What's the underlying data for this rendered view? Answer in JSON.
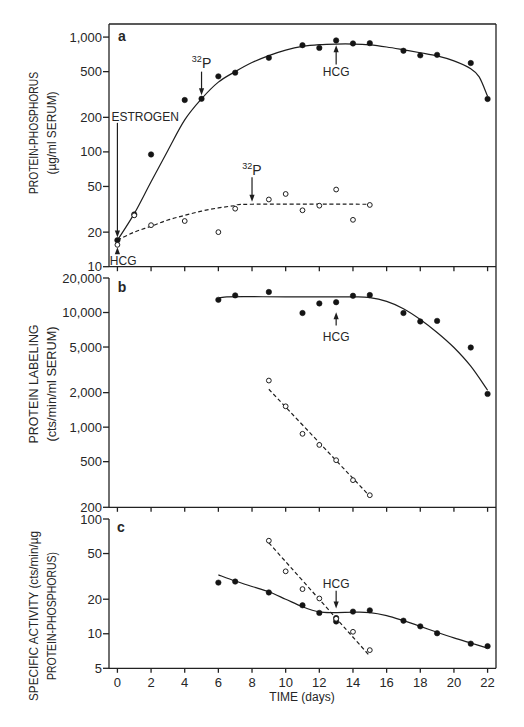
{
  "chart_data": {
    "type": "scatter",
    "title": "",
    "xlabel": "TIME (days)",
    "xlim": [
      -0.5,
      22.5
    ],
    "xticks": [
      0,
      2,
      4,
      6,
      8,
      10,
      12,
      14,
      16,
      18,
      20,
      22
    ],
    "xtick_labels": [
      "0",
      "2",
      "4",
      "6",
      "8",
      "10",
      "12",
      "14",
      "16",
      "18",
      "20",
      "22"
    ],
    "grid": false,
    "legend": "none",
    "panels": [
      {
        "id": "a",
        "letter": "a",
        "ylabel_lines": [
          "PROTEIN-PHOSPHORUS",
          "(µg/ml SERUM)"
        ],
        "yscale": "log",
        "ylim": [
          10,
          1300
        ],
        "yticks": [
          10,
          20,
          50,
          100,
          200,
          500,
          1000
        ],
        "ytick_labels": [
          "10",
          "20",
          "50",
          "100",
          "200",
          "500",
          "1,000"
        ],
        "series": [
          {
            "name": "filled",
            "marker": "filled-circle",
            "points": [
              [
                0,
                17
              ],
              [
                1,
                28.5
              ],
              [
                2,
                95
              ],
              [
                4,
                283
              ],
              [
                5,
                290
              ],
              [
                6,
                455
              ],
              [
                7,
                490
              ],
              [
                9,
                660
              ],
              [
                11,
                850
              ],
              [
                12,
                805
              ],
              [
                13,
                935
              ],
              [
                14,
                880
              ],
              [
                15,
                885
              ],
              [
                17,
                760
              ],
              [
                18,
                693
              ],
              [
                19,
                700
              ],
              [
                21,
                594
              ],
              [
                22,
                289
              ]
            ]
          },
          {
            "name": "open",
            "marker": "open-circle",
            "points": [
              [
                0,
                15.5
              ],
              [
                1,
                28
              ],
              [
                2,
                23
              ],
              [
                4,
                25
              ],
              [
                6,
                20
              ],
              [
                7,
                32
              ],
              [
                9,
                38.5
              ],
              [
                10,
                43
              ],
              [
                11,
                31
              ],
              [
                12,
                34
              ],
              [
                13,
                47
              ],
              [
                14,
                25.6
              ],
              [
                15,
                34.5
              ]
            ]
          }
        ],
        "fits": [
          {
            "name": "filled-fit",
            "style": "solid",
            "points": [
              [
                0,
                17
              ],
              [
                1,
                29
              ],
              [
                2,
                55
              ],
              [
                3,
                103
              ],
              [
                4,
                190
              ],
              [
                5,
                290
              ],
              [
                6,
                405
              ],
              [
                7,
                500
              ],
              [
                8,
                600
              ],
              [
                9,
                690
              ],
              [
                10,
                770
              ],
              [
                11,
                830
              ],
              [
                12,
                860
              ],
              [
                13,
                870
              ],
              [
                14,
                870
              ],
              [
                15,
                855
              ],
              [
                16,
                820
              ],
              [
                17,
                775
              ],
              [
                18,
                730
              ],
              [
                19,
                685
              ],
              [
                20,
                620
              ],
              [
                21,
                530
              ],
              [
                21.5,
                450
              ],
              [
                22,
                305
              ]
            ]
          },
          {
            "name": "open-fit",
            "style": "dashed",
            "points": [
              [
                0,
                17
              ],
              [
                1,
                20
              ],
              [
                2,
                22.5
              ],
              [
                3,
                25.5
              ],
              [
                4,
                28
              ],
              [
                5,
                30.5
              ],
              [
                6,
                32.5
              ],
              [
                7,
                34
              ],
              [
                8,
                35
              ],
              [
                15,
                35
              ]
            ]
          }
        ],
        "annotations": [
          {
            "text": "ESTROGEN",
            "x": 0,
            "tip": 18,
            "tail": 179,
            "label_x": -0.35,
            "label_y": 200,
            "anchor": "start"
          },
          {
            "text": "HCG",
            "x": 0,
            "tip": 14.8,
            "tail": 12.9,
            "label_x": -0.45,
            "label_y": 11.2,
            "anchor": "start"
          },
          {
            "sup": "32",
            "text": "P",
            "x": 5,
            "tip": 311,
            "tail": 500,
            "label_y": 590
          },
          {
            "sup": "32",
            "text": "P",
            "x": 8,
            "tip": 36.8,
            "tail": 60,
            "label_y": 69
          },
          {
            "text": "HCG",
            "x": 13,
            "tip": 847,
            "tail": 577,
            "label_y": 493
          }
        ]
      },
      {
        "id": "b",
        "letter": "b",
        "ylabel_lines": [
          "PROTEIN LABELING",
          "(cts/min/ml SERUM)"
        ],
        "yscale": "log",
        "ylim": [
          200,
          20000
        ],
        "yticks": [
          200,
          500,
          1000,
          2000,
          5000,
          10000,
          20000
        ],
        "ytick_labels": [
          "200",
          "500",
          "1,000",
          "2,000",
          "5,000",
          "10,000",
          "20,000"
        ],
        "series": [
          {
            "name": "filled",
            "marker": "filled-circle",
            "points": [
              [
                6,
                12900
              ],
              [
                7,
                14100
              ],
              [
                9,
                15100
              ],
              [
                11,
                9900
              ],
              [
                12,
                12000
              ],
              [
                13,
                12300
              ],
              [
                14,
                14000
              ],
              [
                15,
                14200
              ],
              [
                17,
                9900
              ],
              [
                18,
                8350
              ],
              [
                19,
                8450
              ],
              [
                21,
                4950
              ],
              [
                22,
                1950
              ]
            ]
          },
          {
            "name": "open",
            "marker": "open-circle",
            "points": [
              [
                9,
                2550
              ],
              [
                10,
                1520
              ],
              [
                11,
                875
              ],
              [
                12,
                700
              ],
              [
                13,
                515
              ],
              [
                14,
                345
              ],
              [
                15,
                255
              ]
            ]
          }
        ],
        "fits": [
          {
            "name": "filled-fit",
            "style": "solid",
            "points": [
              [
                6,
                12900
              ],
              [
                6.5,
                13700
              ],
              [
                10,
                13700
              ],
              [
                14,
                13700
              ],
              [
                15,
                13500
              ],
              [
                16,
                12500
              ],
              [
                17,
                10800
              ],
              [
                18,
                8700
              ],
              [
                19,
                6700
              ],
              [
                20,
                4950
              ],
              [
                21,
                3400
              ],
              [
                22,
                2100
              ]
            ]
          },
          {
            "name": "open-fit",
            "style": "dashed",
            "points": [
              [
                9,
                2140
              ],
              [
                15,
                250
              ]
            ]
          }
        ],
        "annotations": [
          {
            "text": "HCG",
            "x": 13,
            "tip": 10040,
            "tail": 7700,
            "label_y": 6080
          }
        ]
      },
      {
        "id": "c",
        "letter": "c",
        "ylabel_lines": [
          "SPECIFIC ACTIVITY (cts/min/µg",
          "PROTEIN-PHOSPHORUS)"
        ],
        "yscale": "log",
        "ylim": [
          5,
          100
        ],
        "yticks": [
          5,
          10,
          20,
          50,
          100
        ],
        "ytick_labels": [
          "5",
          "10",
          "20",
          "50",
          "100"
        ],
        "series": [
          {
            "name": "filled",
            "marker": "filled-circle",
            "points": [
              [
                6,
                27.9
              ],
              [
                7,
                28.5
              ],
              [
                9,
                22.9
              ],
              [
                11,
                17.7
              ],
              [
                12,
                15.2
              ],
              [
                13,
                13.7
              ],
              [
                13,
                12.8
              ],
              [
                14,
                15.6
              ],
              [
                15,
                16
              ],
              [
                17,
                13
              ],
              [
                18,
                11.6
              ],
              [
                19,
                10.1
              ],
              [
                21,
                8.2
              ],
              [
                22,
                7.8
              ]
            ]
          },
          {
            "name": "open",
            "marker": "open-circle",
            "points": [
              [
                9,
                64.7
              ],
              [
                10,
                35
              ],
              [
                11,
                24.5
              ],
              [
                12,
                20.3
              ],
              [
                13,
                13.5
              ],
              [
                14,
                10.4
              ],
              [
                15,
                7.2
              ]
            ]
          }
        ],
        "fits": [
          {
            "name": "filled-fit",
            "style": "solid",
            "points": [
              [
                6,
                32.6
              ],
              [
                7,
                28.8
              ],
              [
                8,
                25.8
              ],
              [
                9,
                23.2
              ],
              [
                10,
                20
              ],
              [
                11,
                17.2
              ],
              [
                12,
                15.5
              ],
              [
                13,
                15.3
              ],
              [
                14,
                15.4
              ],
              [
                15,
                15.3
              ],
              [
                16,
                14.4
              ],
              [
                17,
                13
              ],
              [
                18,
                11.6
              ],
              [
                19,
                10.3
              ],
              [
                20,
                9.2
              ],
              [
                21,
                8.3
              ],
              [
                22,
                7.5
              ]
            ]
          },
          {
            "name": "open-fit",
            "style": "dashed",
            "points": [
              [
                9,
                62
              ],
              [
                15,
                6.4
              ]
            ]
          }
        ],
        "annotations": [
          {
            "text": "HCG",
            "x": 13,
            "tip": 16.6,
            "tail": 23.7,
            "label_y": 27
          }
        ]
      }
    ]
  }
}
